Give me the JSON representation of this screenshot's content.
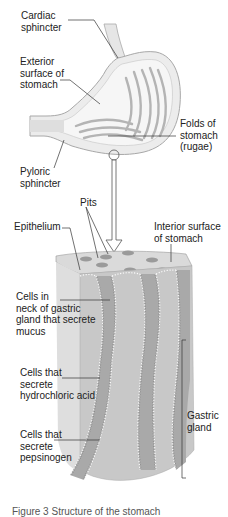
{
  "figure": {
    "type": "anatomical diagram",
    "caption": "Figure 3 Structure of the stomach"
  },
  "labels": {
    "cardiac_sphincter": "Cardiac\nsphincter",
    "exterior_surface": "Exterior\nsurface of\nstomach",
    "folds": "Folds of\nstomach\n(rugae)",
    "pyloric_sphincter": "Pyloric\nsphincter",
    "pits": "Pits",
    "epithelium": "Epithelium",
    "interior_surface": "Interior surface\nof stomach",
    "neck_cells": "Cells in\nneck of gastric\ngland that secrete\nmucus",
    "hcl_cells": "Cells that\nsecrete\nhydrochloric acid",
    "pepsinogen_cells": "Cells that\nsecrete\npepsinogen",
    "gastric_gland": "Gastric\ngland"
  },
  "colors": {
    "stomach_wall": "#dcdcdc",
    "stomach_fill": "#f0f0f0",
    "rugae": "#b8b8b8",
    "tissue": "#c8c8c8",
    "tissue_dark": "#a9a9a9",
    "pit": "#9a9a9a",
    "leader": "#333333"
  }
}
